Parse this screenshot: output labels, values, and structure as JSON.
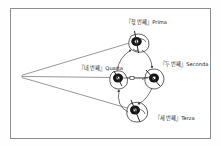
{
  "figure": {
    "title": "",
    "background_color": "#ffffff",
    "border_color": "#8d8d8d",
    "ink_color": "#1c1c1c",
    "line_color": "#8a8a8a"
  },
  "labels": {
    "prima": "『찫 번째』Prima",
    "seconda": "『두 번째』Seconda",
    "terza": "『세 번째』Terza",
    "quarta": "『네 번째』Quarta"
  },
  "guards": [
    {
      "name": "prima",
      "order": 1,
      "italian": "Prima",
      "korean": "찫 번째",
      "x": 136,
      "y": 42
    },
    {
      "name": "seconda",
      "order": 2,
      "italian": "Seconda",
      "korean": "두 번째",
      "x": 154,
      "y": 77
    },
    {
      "name": "terza",
      "order": 3,
      "italian": "Terza",
      "korean": "세 번째",
      "x": 135,
      "y": 110
    },
    {
      "name": "quarta",
      "order": 4,
      "italian": "Quarta",
      "korean": "네 번째",
      "x": 118,
      "y": 78
    }
  ],
  "apex": {
    "x": 22,
    "y": 76
  },
  "sight_lines": [
    {
      "from": "apex",
      "to": "prima"
    },
    {
      "from": "apex",
      "to": "quarta"
    },
    {
      "from": "apex",
      "to": "terza"
    }
  ],
  "rotation_arrows": [
    {
      "from": "prima",
      "to": "seconda"
    },
    {
      "from": "seconda",
      "to": "terza"
    },
    {
      "from": "terza",
      "to": "quarta"
    },
    {
      "from": "quarta",
      "to": "prima"
    }
  ]
}
